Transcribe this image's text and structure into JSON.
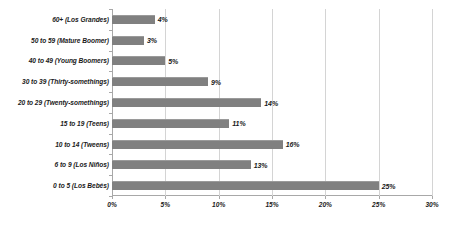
{
  "chart_data": {
    "type": "bar",
    "orientation": "horizontal",
    "title": "",
    "subtitle": "",
    "xlabel": "",
    "ylabel": "",
    "xlim": [
      0,
      30
    ],
    "xticks": [
      "0%",
      "5%",
      "10%",
      "15%",
      "20%",
      "25%",
      "30%"
    ],
    "xtick_values": [
      0,
      5,
      10,
      15,
      20,
      25,
      30
    ],
    "grid": true,
    "grid_axis": "x",
    "legend": false,
    "legend_position": "none",
    "bar_color": "#808080",
    "gridline_color": "#d4d4d4",
    "axis_color": "#a8a8a8",
    "text_color": "#1a1a1a",
    "background": "#ffffff",
    "value_suffix": "%",
    "categories": [
      "60+ (Los Grandes)",
      "50 to 59 (Mature Boomer)",
      "40 to 49 (Young Boomers)",
      "30 to 39 (Thirty-somethings)",
      "20 to 29 (Twenty-somethings)",
      "15 to 19 (Teens)",
      "10 to 14 (Tweens)",
      "6 to 9 (Los Niños)",
      "0 to 5 (Los Bebés)"
    ],
    "values": [
      4,
      3,
      5,
      9,
      14,
      11,
      16,
      13,
      25
    ],
    "data_labels": [
      "4%",
      "3%",
      "5%",
      "9%",
      "14%",
      "11%",
      "16%",
      "13%",
      "25%"
    ],
    "bars": [
      {
        "category": "60+ (Los Grandes)",
        "value": 4,
        "label": "4%"
      },
      {
        "category": "50 to 59 (Mature Boomer)",
        "value": 3,
        "label": "3%"
      },
      {
        "category": "40 to 49 (Young Boomers)",
        "value": 5,
        "label": "5%"
      },
      {
        "category": "30 to 39 (Thirty-somethings)",
        "value": 9,
        "label": "9%"
      },
      {
        "category": "20 to 29 (Twenty-somethings)",
        "value": 14,
        "label": "14%"
      },
      {
        "category": "15 to 19 (Teens)",
        "value": 11,
        "label": "11%"
      },
      {
        "category": "10 to 14 (Tweens)",
        "value": 16,
        "label": "16%"
      },
      {
        "category": "6 to 9 (Los Niños)",
        "value": 13,
        "label": "13%"
      },
      {
        "category": "0 to 5 (Los Bebés)",
        "value": 25,
        "label": "25%"
      }
    ]
  }
}
